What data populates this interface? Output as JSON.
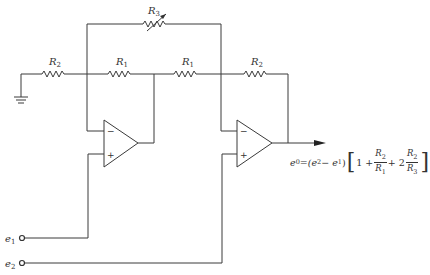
{
  "diagram": {
    "components": {
      "r3": {
        "label": "R",
        "sub": "3",
        "type": "variable-resistor"
      },
      "r2_left": {
        "label": "R",
        "sub": "2",
        "type": "resistor"
      },
      "r1_left": {
        "label": "R",
        "sub": "1",
        "type": "resistor"
      },
      "r1_right": {
        "label": "R",
        "sub": "1",
        "type": "resistor"
      },
      "r2_right": {
        "label": "R",
        "sub": "2",
        "type": "resistor"
      },
      "opamp1": {
        "minus": "−",
        "plus": "+"
      },
      "opamp2": {
        "minus": "−",
        "plus": "+"
      },
      "ground": {
        "type": "ground-icon"
      }
    },
    "inputs": {
      "e1": {
        "label": "e",
        "sub": "1"
      },
      "e2": {
        "label": "e",
        "sub": "2"
      }
    },
    "output_equation": {
      "lhs": "e",
      "lhs_sub": "0",
      "eq": "=",
      "paren": "(e",
      "e2_sub": "2",
      "minus": " − e",
      "e1_sub": "1",
      "paren_close": ")",
      "one_plus": "1 + ",
      "frac1_num": "R",
      "frac1_num_sub": "2",
      "frac1_den": "R",
      "frac1_den_sub": "1",
      "plus_two": " + 2",
      "frac2_num": "R",
      "frac2_num_sub": "2",
      "frac2_den": "R",
      "frac2_den_sub": "3",
      "bracket_open": "[",
      "bracket_close": "]"
    },
    "colors": {
      "line": "#3a3a3a",
      "background": "#ffffff"
    }
  }
}
